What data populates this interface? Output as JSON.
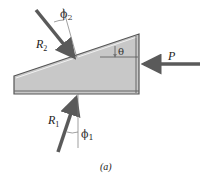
{
  "figure": {
    "caption": "(a)",
    "labels": {
      "R2": "R",
      "R2_sub": "2",
      "R1": "R",
      "R1_sub": "1",
      "P": "P",
      "theta": "θ",
      "phi2": "ϕ",
      "phi2_sub": "2",
      "phi1": "ϕ",
      "phi1_sub": "1"
    },
    "colors": {
      "wedge_fill": "#c8c8c8",
      "wedge_edge": "#555555",
      "arrow": "#5a5a5a",
      "guide_line": "#777777"
    }
  }
}
